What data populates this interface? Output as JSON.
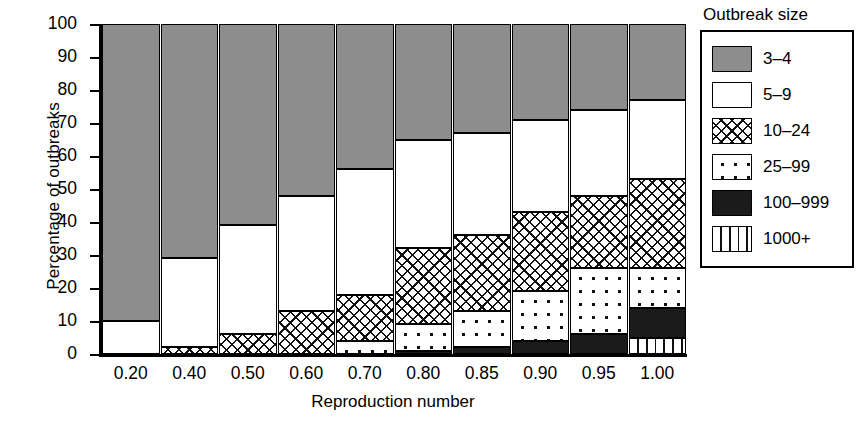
{
  "chart_data": {
    "type": "bar",
    "subtype": "stacked-bar-100-percent",
    "title": "",
    "xlabel": "Reproduction number",
    "ylabel": "Percentage of outbreaks",
    "categories": [
      "0.20",
      "0.40",
      "0.50",
      "0.60",
      "0.70",
      "0.80",
      "0.85",
      "0.90",
      "0.95",
      "1.00"
    ],
    "ylim": [
      0,
      100
    ],
    "yticks": [
      0,
      10,
      20,
      30,
      40,
      50,
      60,
      70,
      80,
      90,
      100
    ],
    "grid": false,
    "legend_title": "Outbreak size",
    "legend_position": "right",
    "stack_order_bottom_to_top": [
      "1000+",
      "100-999",
      "25-99",
      "10-24",
      "5-9",
      "3-4"
    ],
    "series": [
      {
        "name": "1000+",
        "legend_label": "1000+",
        "fill": "vertical-lines",
        "values": [
          0,
          0,
          0,
          0,
          0,
          0,
          0,
          0,
          0,
          5
        ]
      },
      {
        "name": "100-999",
        "legend_label": "100–999",
        "fill": "solid-black",
        "values": [
          0,
          0,
          0,
          0,
          0,
          1,
          2,
          4,
          6,
          9
        ]
      },
      {
        "name": "25-99",
        "legend_label": "25–99",
        "fill": "dots",
        "values": [
          0,
          0,
          0,
          0,
          4,
          8,
          11,
          15,
          20,
          12
        ]
      },
      {
        "name": "10-24",
        "legend_label": "10–24",
        "fill": "cross-hatch",
        "values": [
          0,
          2,
          6,
          13,
          14,
          23,
          23,
          24,
          22,
          27
        ]
      },
      {
        "name": "5-9",
        "legend_label": "5–9",
        "fill": "white",
        "values": [
          10,
          27,
          33,
          35,
          38,
          33,
          31,
          28,
          26,
          24
        ]
      },
      {
        "name": "3-4",
        "legend_label": "3–4",
        "fill": "gray",
        "values": [
          90,
          71,
          61,
          52,
          44,
          35,
          33,
          29,
          26,
          23
        ]
      }
    ],
    "cumulative_tops_bottom_to_top": {
      "0.20": [
        0,
        0,
        0,
        0,
        10,
        100
      ],
      "0.40": [
        0,
        0,
        0,
        2,
        29,
        100
      ],
      "0.50": [
        0,
        0,
        0,
        6,
        39,
        100
      ],
      "0.60": [
        0,
        0,
        0,
        13,
        48,
        100
      ],
      "0.70": [
        0,
        0,
        4,
        18,
        56,
        100
      ],
      "0.80": [
        0,
        1,
        9,
        32,
        65,
        100
      ],
      "0.85": [
        0,
        2,
        13,
        36,
        67,
        100
      ],
      "0.90": [
        0,
        4,
        19,
        43,
        71,
        100
      ],
      "0.95": [
        0,
        6,
        26,
        48,
        74,
        100
      ],
      "1.00": [
        5,
        14,
        26,
        53,
        77,
        100
      ]
    }
  },
  "colors": {
    "gray_fill": "#8d8d8d",
    "black_fill": "#1b1b1b",
    "white_fill": "#ffffff",
    "line": "#000000",
    "background": "#ffffff"
  },
  "legend": {
    "title": "Outbreak size",
    "items": [
      {
        "label": "3–4",
        "fill": "gray"
      },
      {
        "label": "5–9",
        "fill": "white"
      },
      {
        "label": "10–24",
        "fill": "cross-hatch"
      },
      {
        "label": "25–99",
        "fill": "dots"
      },
      {
        "label": "100–999",
        "fill": "solid-black"
      },
      {
        "label": "1000+",
        "fill": "vertical-lines"
      }
    ]
  }
}
